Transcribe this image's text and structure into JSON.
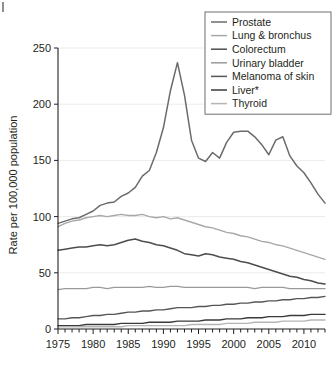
{
  "chart_data": {
    "type": "line",
    "title": "",
    "xlabel": "",
    "ylabel": "Rate per 100,000 population",
    "xlim": [
      1975,
      2013
    ],
    "ylim": [
      0,
      250
    ],
    "yticks": [
      0,
      50,
      100,
      150,
      200,
      250
    ],
    "xticks": [
      1975,
      1980,
      1985,
      1990,
      1995,
      2000,
      2005,
      2010
    ],
    "xtick_labels": [
      "1975",
      "1980",
      "1985",
      "1990",
      "1995",
      "2000",
      "2005",
      "2010"
    ],
    "ytick_labels": [
      "0",
      "50",
      "100",
      "150",
      "200",
      "250"
    ],
    "minor_xtick_interval": 1,
    "grid": "light horizontal gridlines at y major ticks",
    "legend_position": "top-right",
    "x": [
      1975,
      1976,
      1977,
      1978,
      1979,
      1980,
      1981,
      1982,
      1983,
      1984,
      1985,
      1986,
      1987,
      1988,
      1989,
      1990,
      1991,
      1992,
      1993,
      1994,
      1995,
      1996,
      1997,
      1998,
      1999,
      2000,
      2001,
      2002,
      2003,
      2004,
      2005,
      2006,
      2007,
      2008,
      2009,
      2010,
      2011,
      2012,
      2013
    ],
    "series": [
      {
        "name": "Prostate",
        "color": "#6b6b6b",
        "width": 1.5,
        "values": [
          94,
          96,
          98,
          99,
          102,
          105,
          110,
          112,
          113,
          118,
          121,
          126,
          136,
          141,
          157,
          179,
          212,
          237,
          208,
          168,
          152,
          149,
          157,
          152,
          166,
          175,
          176,
          176,
          171,
          164,
          155,
          168,
          171,
          154,
          145,
          139,
          130,
          120,
          112
        ]
      },
      {
        "name": "Lung & bronchus",
        "color": "#a8a8a8",
        "width": 1.4,
        "values": [
          91,
          94,
          96,
          97,
          99,
          100,
          101,
          100,
          101,
          102,
          101,
          101,
          102,
          100,
          99,
          100,
          98,
          99,
          97,
          95,
          93,
          91,
          90,
          88,
          86,
          85,
          83,
          82,
          80,
          78,
          77,
          75,
          74,
          72,
          70,
          68,
          66,
          64,
          62
        ]
      },
      {
        "name": "Colorectum",
        "color": "#4d4d4d",
        "width": 1.5,
        "values": [
          70,
          71,
          72,
          73,
          73,
          74,
          75,
          74,
          75,
          77,
          79,
          80,
          78,
          77,
          75,
          74,
          72,
          70,
          67,
          66,
          65,
          67,
          66,
          64,
          63,
          62,
          60,
          59,
          57,
          55,
          53,
          51,
          49,
          47,
          46,
          44,
          43,
          41,
          40
        ]
      },
      {
        "name": "Urinary bladder",
        "color": "#9a9a9a",
        "width": 1.3,
        "values": [
          35,
          36,
          36,
          36,
          36,
          37,
          37,
          36,
          37,
          37,
          37,
          37,
          37,
          38,
          37,
          37,
          38,
          38,
          37,
          37,
          37,
          37,
          37,
          37,
          37,
          37,
          37,
          37,
          36,
          37,
          37,
          37,
          37,
          36,
          36,
          36,
          36,
          36,
          36
        ]
      },
      {
        "name": "Melanoma of skin",
        "color": "#565656",
        "width": 1.4,
        "values": [
          9,
          9,
          10,
          10,
          11,
          12,
          12,
          13,
          13,
          14,
          15,
          15,
          16,
          16,
          17,
          17,
          18,
          19,
          19,
          19,
          20,
          20,
          21,
          21,
          22,
          22,
          23,
          23,
          24,
          24,
          25,
          25,
          26,
          26,
          27,
          27,
          28,
          28,
          29
        ]
      },
      {
        "name": "Liver*",
        "color": "#3a3a3a",
        "width": 1.4,
        "values": [
          3,
          3,
          3,
          3,
          4,
          4,
          4,
          4,
          4,
          5,
          5,
          5,
          5,
          6,
          6,
          6,
          6,
          7,
          7,
          7,
          7,
          8,
          8,
          8,
          9,
          9,
          9,
          10,
          10,
          10,
          11,
          11,
          11,
          12,
          12,
          12,
          13,
          13,
          13
        ]
      },
      {
        "name": "Thyroid",
        "color": "#b5b5b5",
        "width": 1.3,
        "values": [
          2,
          2,
          2,
          2,
          2,
          2,
          2,
          2,
          2,
          2,
          3,
          3,
          3,
          3,
          3,
          3,
          3,
          3,
          3,
          4,
          4,
          4,
          4,
          4,
          5,
          5,
          5,
          5,
          6,
          6,
          6,
          6,
          7,
          7,
          7,
          7,
          8,
          8,
          8
        ]
      }
    ]
  },
  "legend": {
    "items": [
      {
        "label": "Prostate"
      },
      {
        "label": "Lung & bronchus"
      },
      {
        "label": "Colorectum"
      },
      {
        "label": "Urinary bladder"
      },
      {
        "label": "Melanoma of skin"
      },
      {
        "label": "Liver*"
      },
      {
        "label": "Thyroid"
      }
    ]
  }
}
